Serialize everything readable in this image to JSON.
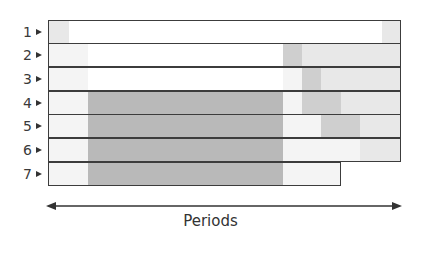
{
  "colors": {
    "white": "#ffffff",
    "very_light": "#f4f4f4",
    "light": "#e8e8e8",
    "medium": "#cfcfcf",
    "dark": "#b9b9b9",
    "border": "#3c3c3c"
  },
  "axis": {
    "label": "Periods",
    "direction": "bidirectional-arrow"
  },
  "rows": [
    {
      "label": "1",
      "start": 48,
      "end": 401,
      "segments": [
        {
          "from": 48,
          "to": 68,
          "shade": "light"
        },
        {
          "from": 68,
          "to": 381,
          "shade": "white"
        },
        {
          "from": 381,
          "to": 401,
          "shade": "light"
        }
      ]
    },
    {
      "label": "2",
      "start": 48,
      "end": 401,
      "segments": [
        {
          "from": 48,
          "to": 87,
          "shade": "very_light"
        },
        {
          "from": 87,
          "to": 282,
          "shade": "white"
        },
        {
          "from": 282,
          "to": 301,
          "shade": "medium"
        },
        {
          "from": 301,
          "to": 401,
          "shade": "light"
        }
      ]
    },
    {
      "label": "3",
      "start": 48,
      "end": 401,
      "segments": [
        {
          "from": 48,
          "to": 87,
          "shade": "very_light"
        },
        {
          "from": 87,
          "to": 282,
          "shade": "white"
        },
        {
          "from": 282,
          "to": 301,
          "shade": "very_light"
        },
        {
          "from": 301,
          "to": 320,
          "shade": "medium"
        },
        {
          "from": 320,
          "to": 401,
          "shade": "light"
        }
      ]
    },
    {
      "label": "4",
      "start": 48,
      "end": 401,
      "segments": [
        {
          "from": 48,
          "to": 87,
          "shade": "very_light"
        },
        {
          "from": 87,
          "to": 282,
          "shade": "dark"
        },
        {
          "from": 282,
          "to": 301,
          "shade": "very_light"
        },
        {
          "from": 301,
          "to": 340,
          "shade": "medium"
        },
        {
          "from": 340,
          "to": 401,
          "shade": "light"
        }
      ]
    },
    {
      "label": "5",
      "start": 48,
      "end": 401,
      "segments": [
        {
          "from": 48,
          "to": 87,
          "shade": "very_light"
        },
        {
          "from": 87,
          "to": 282,
          "shade": "dark"
        },
        {
          "from": 282,
          "to": 320,
          "shade": "very_light"
        },
        {
          "from": 320,
          "to": 359,
          "shade": "medium"
        },
        {
          "from": 359,
          "to": 401,
          "shade": "light"
        }
      ]
    },
    {
      "label": "6",
      "start": 48,
      "end": 401,
      "segments": [
        {
          "from": 48,
          "to": 87,
          "shade": "very_light"
        },
        {
          "from": 87,
          "to": 282,
          "shade": "dark"
        },
        {
          "from": 282,
          "to": 359,
          "shade": "very_light"
        },
        {
          "from": 359,
          "to": 401,
          "shade": "light"
        }
      ]
    },
    {
      "label": "7",
      "start": 48,
      "end": 341,
      "segments": [
        {
          "from": 48,
          "to": 87,
          "shade": "very_light"
        },
        {
          "from": 87,
          "to": 282,
          "shade": "dark"
        },
        {
          "from": 282,
          "to": 341,
          "shade": "very_light"
        }
      ]
    }
  ]
}
